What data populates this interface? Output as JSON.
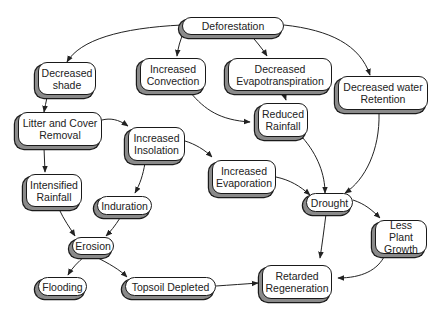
{
  "diagram": {
    "type": "concept-map",
    "colors": {
      "node_fill": "#ffffff",
      "node_border": "#1a1a1a",
      "node_shadow": "#8a8a8a",
      "edge": "#222222",
      "text": "#222222"
    },
    "nodes": [
      {
        "id": "deforestation",
        "label": "Deforestation"
      },
      {
        "id": "decreased_shade",
        "label": "Decreased\nshade"
      },
      {
        "id": "increased_convection",
        "label": "Increased\nConvection"
      },
      {
        "id": "decreased_evapotranspiration",
        "label": "Decreased\nEvapotranspiration"
      },
      {
        "id": "decreased_water_retention",
        "label": "Decreased water\nRetention"
      },
      {
        "id": "litter_cover_removal",
        "label": "Litter and Cover\nRemoval"
      },
      {
        "id": "reduced_rainfall",
        "label": "Reduced\nRainfall"
      },
      {
        "id": "increased_insolation",
        "label": "Increased\nInsolation"
      },
      {
        "id": "increased_evaporation",
        "label": "Increased\nEvaporation"
      },
      {
        "id": "intensified_rainfall",
        "label": "Intensified\nRainfall"
      },
      {
        "id": "drought",
        "label": "Drought"
      },
      {
        "id": "induration",
        "label": "Induration"
      },
      {
        "id": "less_plant_growth",
        "label": "Less Plant\nGrowth"
      },
      {
        "id": "erosion",
        "label": "Erosion"
      },
      {
        "id": "flooding",
        "label": "Flooding"
      },
      {
        "id": "topsoil_depleted",
        "label": "Topsoil Depleted"
      },
      {
        "id": "retarded_regeneration",
        "label": "Retarded\nRegeneration"
      }
    ],
    "edges": [
      {
        "from": "deforestation",
        "to": "decreased_shade"
      },
      {
        "from": "deforestation",
        "to": "increased_convection"
      },
      {
        "from": "deforestation",
        "to": "decreased_evapotranspiration"
      },
      {
        "from": "deforestation",
        "to": "decreased_water_retention"
      },
      {
        "from": "decreased_shade",
        "to": "litter_cover_removal"
      },
      {
        "from": "increased_convection",
        "to": "reduced_rainfall"
      },
      {
        "from": "decreased_evapotranspiration",
        "to": "reduced_rainfall"
      },
      {
        "from": "litter_cover_removal",
        "to": "increased_insolation"
      },
      {
        "from": "litter_cover_removal",
        "to": "intensified_rainfall"
      },
      {
        "from": "increased_insolation",
        "to": "increased_evaporation"
      },
      {
        "from": "increased_insolation",
        "to": "induration"
      },
      {
        "from": "reduced_rainfall",
        "to": "drought"
      },
      {
        "from": "decreased_water_retention",
        "to": "drought"
      },
      {
        "from": "increased_evaporation",
        "to": "drought"
      },
      {
        "from": "drought",
        "to": "less_plant_growth"
      },
      {
        "from": "drought",
        "to": "retarded_regeneration"
      },
      {
        "from": "less_plant_growth",
        "to": "retarded_regeneration"
      },
      {
        "from": "intensified_rainfall",
        "to": "erosion"
      },
      {
        "from": "induration",
        "to": "erosion"
      },
      {
        "from": "erosion",
        "to": "flooding"
      },
      {
        "from": "erosion",
        "to": "topsoil_depleted"
      },
      {
        "from": "topsoil_depleted",
        "to": "retarded_regeneration"
      }
    ]
  }
}
